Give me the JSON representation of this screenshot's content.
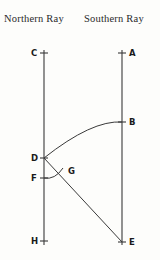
{
  "figure": {
    "type": "geometric-ray-diagram",
    "background_color": "#fdfdfb",
    "ink_color": "#3a3a3a",
    "label_color": "#1a1a1a"
  },
  "headers": {
    "northern": "Northern Ray",
    "southern": "Southern Ray"
  },
  "rays": [
    {
      "name": "northern-ray-line",
      "x": 44,
      "y_top": 50,
      "y_bottom": 245
    },
    {
      "name": "southern-ray-line",
      "x": 122,
      "y_top": 50,
      "y_bottom": 245
    }
  ],
  "points": [
    {
      "id": "C",
      "label": "C",
      "x": 44,
      "y": 53,
      "label_side": "left",
      "tick": true
    },
    {
      "id": "A",
      "label": "A",
      "x": 122,
      "y": 53,
      "label_side": "right",
      "tick": true
    },
    {
      "id": "B",
      "label": "B",
      "x": 122,
      "y": 122,
      "label_side": "right",
      "tick": true
    },
    {
      "id": "D",
      "label": "D",
      "x": 44,
      "y": 158,
      "label_side": "left",
      "tick": true
    },
    {
      "id": "G",
      "label": "G",
      "x": 61,
      "y": 171,
      "label_side": "right",
      "tick": false
    },
    {
      "id": "F",
      "label": "F",
      "x": 44,
      "y": 178,
      "label_side": "left",
      "tick": true
    },
    {
      "id": "H",
      "label": "H",
      "x": 44,
      "y": 241,
      "label_side": "left",
      "tick": true
    },
    {
      "id": "E",
      "label": "E",
      "x": 122,
      "y": 242,
      "label_side": "right",
      "tick": true
    }
  ],
  "curves": [
    {
      "name": "arc-D-to-B",
      "from": "D",
      "to": "B",
      "kind": "arc",
      "bulge": "up",
      "path": "M 44 158 Q 92 120 122 122"
    },
    {
      "name": "segment-D-to-E",
      "from": "D",
      "to": "E",
      "kind": "line",
      "path": "M 44 158 L 122 242"
    },
    {
      "name": "arc-F-to-G",
      "from": "F",
      "to": "G",
      "kind": "arc",
      "bulge": "down",
      "path": "M 44 178 Q 55 180 63 168"
    }
  ]
}
